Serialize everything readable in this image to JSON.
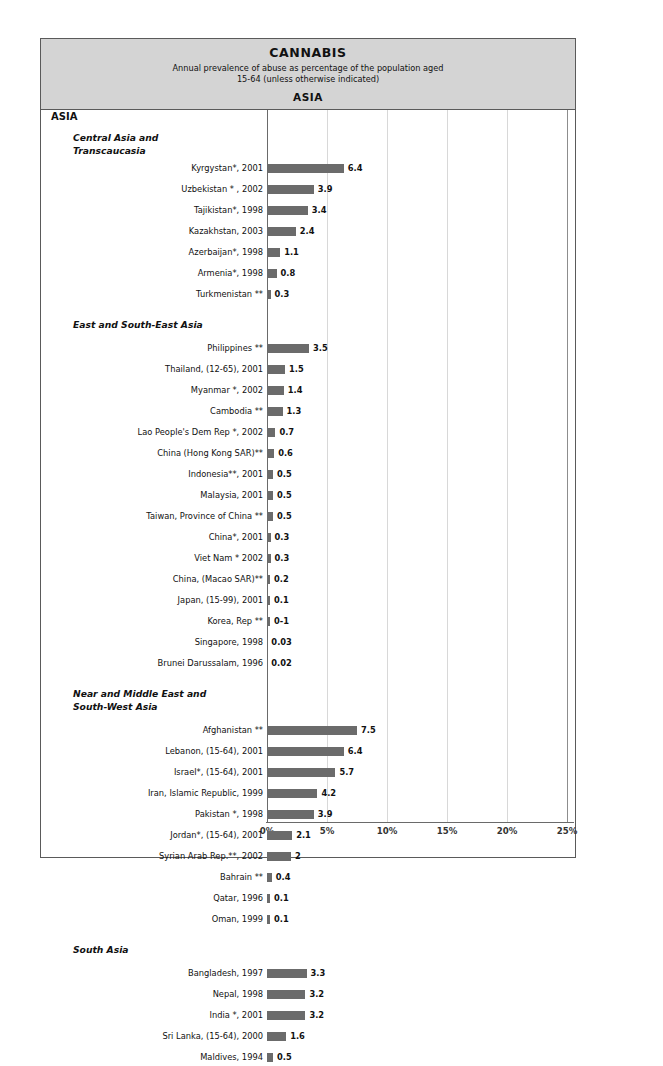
{
  "header": {
    "title": "CANNABIS",
    "subtitle_line1": "Annual prevalence of abuse as percentage of the population aged",
    "subtitle_line2": "15-64 (unless otherwise indicated)",
    "region": "ASIA"
  },
  "region_label": "ASIA",
  "axis": {
    "ticks": [
      "0%",
      "5%",
      "10%",
      "15%",
      "20%",
      "25%"
    ],
    "tick_values": [
      0,
      5,
      10,
      15,
      20,
      25
    ],
    "min": 0,
    "max": 25
  },
  "colors": {
    "bar": "#6b6b6b",
    "header_bg": "#d4d4d4",
    "frame": "#5a5a5a",
    "gridline": "#d8d8d8"
  },
  "sections": [
    {
      "title": "Central Asia and\nTranscaucasia",
      "rows": [
        {
          "label": "Kyrgystan*, 2001",
          "value": 6.4,
          "display": "6.4"
        },
        {
          "label": "Uzbekistan * , 2002",
          "value": 3.9,
          "display": "3.9"
        },
        {
          "label": "Tajikistan*, 1998",
          "value": 3.4,
          "display": "3.4"
        },
        {
          "label": "Kazakhstan, 2003",
          "value": 2.4,
          "display": "2.4"
        },
        {
          "label": "Azerbaijan*, 1998",
          "value": 1.1,
          "display": "1.1"
        },
        {
          "label": "Armenia*, 1998",
          "value": 0.8,
          "display": "0.8"
        },
        {
          "label": "Turkmenistan **",
          "value": 0.3,
          "display": "0.3"
        }
      ]
    },
    {
      "title": "East and South-East Asia",
      "rows": [
        {
          "label": "Philippines **",
          "value": 3.5,
          "display": "3.5"
        },
        {
          "label": "Thailand, (12-65), 2001",
          "value": 1.5,
          "display": "1.5"
        },
        {
          "label": "Myanmar *, 2002",
          "value": 1.4,
          "display": "1.4"
        },
        {
          "label": "Cambodia **",
          "value": 1.3,
          "display": "1.3"
        },
        {
          "label": "Lao People's Dem Rep *, 2002",
          "value": 0.7,
          "display": "0.7"
        },
        {
          "label": "China (Hong Kong SAR)**",
          "value": 0.6,
          "display": "0.6"
        },
        {
          "label": "Indonesia**, 2001",
          "value": 0.5,
          "display": "0.5"
        },
        {
          "label": "Malaysia, 2001",
          "value": 0.5,
          "display": "0.5"
        },
        {
          "label": "Taiwan, Province of China **",
          "value": 0.5,
          "display": "0.5"
        },
        {
          "label": "China*, 2001",
          "value": 0.3,
          "display": "0.3"
        },
        {
          "label": "Viet Nam * 2002",
          "value": 0.3,
          "display": "0.3"
        },
        {
          "label": "China, (Macao SAR)**",
          "value": 0.2,
          "display": "0.2"
        },
        {
          "label": "Japan, (15-99), 2001",
          "value": 0.1,
          "display": "0.1"
        },
        {
          "label": "Korea, Rep **",
          "value": 0.1,
          "display": "0-1"
        },
        {
          "label": "Singapore, 1998",
          "value": 0.03,
          "display": "0.03"
        },
        {
          "label": "Brunei Darussalam, 1996",
          "value": 0.02,
          "display": "0.02"
        }
      ]
    },
    {
      "title": "Near and Middle East and\nSouth-West  Asia",
      "rows": [
        {
          "label": "Afghanistan **",
          "value": 7.5,
          "display": "7.5"
        },
        {
          "label": "Lebanon, (15-64), 2001",
          "value": 6.4,
          "display": "6.4"
        },
        {
          "label": "Israel*, (15-64), 2001",
          "value": 5.7,
          "display": "5.7"
        },
        {
          "label": "Iran, Islamic Republic, 1999",
          "value": 4.2,
          "display": "4.2"
        },
        {
          "label": "Pakistan *, 1998",
          "value": 3.9,
          "display": "3.9"
        },
        {
          "label": "Jordan*, (15-64), 2001",
          "value": 2.1,
          "display": "2.1"
        },
        {
          "label": "Syrian Arab Rep.**, 2002",
          "value": 2.0,
          "display": "2"
        },
        {
          "label": "Bahrain **",
          "value": 0.4,
          "display": "0.4"
        },
        {
          "label": "Qatar, 1996",
          "value": 0.1,
          "display": "0.1"
        },
        {
          "label": "Oman,  1999",
          "value": 0.1,
          "display": "0.1"
        }
      ]
    },
    {
      "title": "South Asia",
      "rows": [
        {
          "label": "Bangladesh, 1997",
          "value": 3.3,
          "display": "3.3"
        },
        {
          "label": "Nepal, 1998",
          "value": 3.2,
          "display": "3.2"
        },
        {
          "label": "India *, 2001",
          "value": 3.2,
          "display": "3.2"
        },
        {
          "label": "Sri Lanka, (15-64), 2000",
          "value": 1.6,
          "display": "1.6"
        },
        {
          "label": "Maldives, 1994",
          "value": 0.5,
          "display": "0.5"
        }
      ]
    }
  ],
  "chart_data": {
    "type": "bar",
    "title": "CANNABIS",
    "subtitle": "Annual prevalence of abuse as percentage of the population aged 15-64 (unless otherwise indicated) - ASIA",
    "orientation": "horizontal",
    "xlabel": "",
    "ylabel": "",
    "xlim": [
      0,
      25
    ],
    "xticks": [
      0,
      5,
      10,
      15,
      20,
      25
    ],
    "xticklabels": [
      "0%",
      "5%",
      "10%",
      "15%",
      "20%",
      "25%"
    ],
    "grid": true,
    "legend": false,
    "groups": [
      {
        "name": "Central Asia and Transcaucasia",
        "categories": [
          "Kyrgystan*, 2001",
          "Uzbekistan * , 2002",
          "Tajikistan*, 1998",
          "Kazakhstan, 2003",
          "Azerbaijan*, 1998",
          "Armenia*, 1998",
          "Turkmenistan **"
        ],
        "values": [
          6.4,
          3.9,
          3.4,
          2.4,
          1.1,
          0.8,
          0.3
        ]
      },
      {
        "name": "East and South-East Asia",
        "categories": [
          "Philippines **",
          "Thailand, (12-65), 2001",
          "Myanmar *, 2002",
          "Cambodia **",
          "Lao People's Dem Rep *, 2002",
          "China (Hong Kong SAR)**",
          "Indonesia**, 2001",
          "Malaysia, 2001",
          "Taiwan, Province of China **",
          "China*, 2001",
          "Viet Nam * 2002",
          "China, (Macao SAR)**",
          "Japan, (15-99), 2001",
          "Korea, Rep **",
          "Singapore, 1998",
          "Brunei Darussalam, 1996"
        ],
        "values": [
          3.5,
          1.5,
          1.4,
          1.3,
          0.7,
          0.6,
          0.5,
          0.5,
          0.5,
          0.3,
          0.3,
          0.2,
          0.1,
          0.1,
          0.03,
          0.02
        ]
      },
      {
        "name": "Near and Middle East and South-West Asia",
        "categories": [
          "Afghanistan **",
          "Lebanon, (15-64), 2001",
          "Israel*, (15-64), 2001",
          "Iran, Islamic Republic, 1999",
          "Pakistan *, 1998",
          "Jordan*, (15-64), 2001",
          "Syrian Arab Rep.**, 2002",
          "Bahrain **",
          "Qatar, 1996",
          "Oman,  1999"
        ],
        "values": [
          7.5,
          6.4,
          5.7,
          4.2,
          3.9,
          2.1,
          2.0,
          0.4,
          0.1,
          0.1
        ]
      },
      {
        "name": "South Asia",
        "categories": [
          "Bangladesh, 1997",
          "Nepal, 1998",
          "India *, 2001",
          "Sri Lanka, (15-64), 2000",
          "Maldives, 1994"
        ],
        "values": [
          3.3,
          3.2,
          3.2,
          1.6,
          0.5
        ]
      }
    ]
  }
}
